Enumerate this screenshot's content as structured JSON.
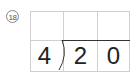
{
  "problem": {
    "number_label": "⑱",
    "number": "18",
    "divisor": "4",
    "dividend_digits": [
      "2",
      "0"
    ],
    "quotient_digits": [
      "",
      "",
      ""
    ]
  },
  "colors": {
    "grid": "#cfcfcf",
    "text": "#222222",
    "bar": "#333333"
  }
}
